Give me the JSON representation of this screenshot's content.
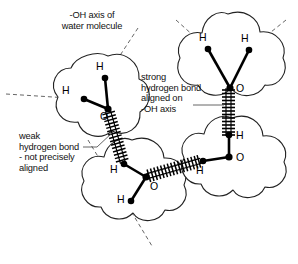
{
  "figure": {
    "title_label": "-OH axis of\nwater molecule",
    "strong_bond_label": "strong\nhydrogen bond\naligned on\n-OH axis",
    "weak_bond_label": "weak\nhydrogen bond\n- not precisely\naligned",
    "colors": {
      "ink": "#111111",
      "cloud_outline": "#222222",
      "bond": "#000000",
      "dash": "#555555",
      "background": "#ffffff"
    }
  },
  "molecules": [
    {
      "id": "molecule-center-left",
      "oxygen_label": "O",
      "hydrogen_labels": [
        "H",
        "H"
      ]
    },
    {
      "id": "molecule-top-right",
      "oxygen_label": "O",
      "hydrogen_labels": [
        "H",
        "H"
      ]
    },
    {
      "id": "molecule-bottom-center",
      "oxygen_label": "O",
      "hydrogen_labels": [
        "H",
        "H"
      ]
    },
    {
      "id": "molecule-right",
      "oxygen_label": "O",
      "hydrogen_labels": [
        "H",
        "H"
      ]
    }
  ],
  "atom_labels": {
    "center_h_left": "H",
    "center_h_top": "H",
    "center_o": "O",
    "topright_h_left": "H",
    "topright_h_right": "H",
    "topright_o": "O",
    "bottom_h_top": "H",
    "bottom_h_bottom": "H",
    "bottom_o": "O",
    "right_h_top": "H",
    "right_h_left": "H",
    "right_o": "O"
  },
  "bonds": {
    "strong_hydrogen_bond": "ladder-vertical",
    "weak_hydrogen_bond": "ladder-diagonal",
    "third_hydrogen_bond": "ladder-horizontal"
  }
}
